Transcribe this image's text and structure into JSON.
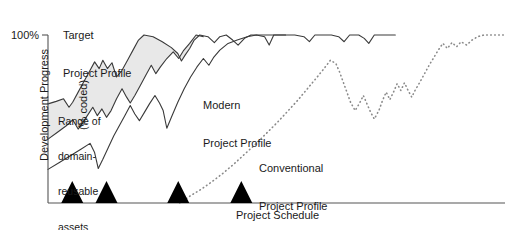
{
  "chart_data": {
    "type": "line",
    "title": "",
    "xlabel": "Project Schedule",
    "ylabel": "Development Progress\n(% coded)",
    "ylabel_line1": "Development Progress",
    "ylabel_line2": "(% coded)",
    "xlim": [
      0,
      100
    ],
    "ylim": [
      0,
      100
    ],
    "grid": false,
    "legend": "inline-annotations",
    "y_ticks": [
      {
        "value": 100,
        "label": "100%"
      }
    ],
    "x_ticks": [],
    "annotations": [
      {
        "name": "target-profile-label",
        "text": "Target\nProject Profile",
        "line1": "Target",
        "line2": "Project Profile",
        "x": 16,
        "y": 97
      },
      {
        "name": "band-label",
        "text": "Range of\ndomain-\nreusable\nassets",
        "line1": "Range of",
        "line2": "domain-",
        "line3": "reusable",
        "line4": "assets",
        "x": 3,
        "y": 66
      },
      {
        "name": "modern-profile-label",
        "text": "Modern\nProject Profile",
        "line1": "Modern",
        "line2": "Project Profile",
        "x": 35,
        "y": 77
      },
      {
        "name": "conventional-profile-label",
        "text": "Conventional\nProject Profile",
        "line1": "Conventional",
        "line2": "Project Profile",
        "x": 49,
        "y": 40
      }
    ],
    "milestone_markers": {
      "name": "milestone-triangles",
      "count": 4,
      "x_values": [
        5.3,
        12.8,
        28.5,
        42.3
      ]
    },
    "series": [
      {
        "name": "Target Project Profile",
        "style": "solid",
        "color": "#3a3a3a",
        "points": [
          [
            0.0,
            59.0
          ],
          [
            1.8,
            60.5
          ],
          [
            3.4,
            62.0
          ],
          [
            4.6,
            57.0
          ],
          [
            5.4,
            60.0
          ],
          [
            6.6,
            66.0
          ],
          [
            7.8,
            72.0
          ],
          [
            9.0,
            78.0
          ],
          [
            10.2,
            84.0
          ],
          [
            11.2,
            80.0
          ],
          [
            12.0,
            85.0
          ],
          [
            13.0,
            80.0
          ],
          [
            14.0,
            83.5
          ],
          [
            15.0,
            75.0
          ],
          [
            16.2,
            79.0
          ],
          [
            17.4,
            85.0
          ],
          [
            18.6,
            91.0
          ],
          [
            19.8,
            97.0
          ],
          [
            21.0,
            100.0
          ],
          [
            23.0,
            99.0
          ],
          [
            25.0,
            96.0
          ],
          [
            27.0,
            92.5
          ],
          [
            28.4,
            89.0
          ],
          [
            29.2,
            84.5
          ],
          [
            30.0,
            88.0
          ],
          [
            31.0,
            92.0
          ],
          [
            32.0,
            97.0
          ],
          [
            33.2,
            100.0
          ],
          [
            35.0,
            99.0
          ],
          [
            36.4,
            95.5
          ],
          [
            37.6,
            99.0
          ],
          [
            39.0,
            100.0
          ],
          [
            40.4,
            97.0
          ],
          [
            41.6,
            94.0
          ],
          [
            43.0,
            98.0
          ],
          [
            44.4,
            100.0
          ],
          [
            52.0,
            100.0
          ]
        ]
      },
      {
        "name": "Range lower bound",
        "style": "solid",
        "color": "#3a3a3a",
        "points": [
          [
            0.0,
            38.0
          ],
          [
            2.0,
            42.0
          ],
          [
            4.0,
            46.0
          ],
          [
            5.4,
            49.5
          ],
          [
            6.6,
            44.0
          ],
          [
            7.4,
            47.0
          ],
          [
            8.6,
            52.0
          ],
          [
            9.8,
            57.0
          ],
          [
            10.8,
            52.0
          ],
          [
            11.8,
            56.0
          ],
          [
            12.8,
            51.0
          ],
          [
            13.8,
            55.0
          ],
          [
            15.0,
            62.0
          ],
          [
            16.2,
            68.0
          ],
          [
            17.2,
            63.0
          ],
          [
            18.0,
            59.5
          ],
          [
            19.0,
            64.0
          ],
          [
            20.2,
            70.0
          ],
          [
            21.4,
            76.0
          ],
          [
            22.6,
            82.0
          ],
          [
            23.6,
            77.0
          ],
          [
            24.6,
            81.0
          ],
          [
            26.0,
            86.0
          ],
          [
            27.4,
            90.0
          ],
          [
            28.6,
            86.0
          ],
          [
            29.6,
            90.5
          ],
          [
            31.0,
            95.0
          ],
          [
            32.4,
            100.0
          ],
          [
            34.0,
            99.0
          ]
        ]
      },
      {
        "name": "Modern Project Profile",
        "style": "solid",
        "color": "#3a3a3a",
        "points": [
          [
            0.0,
            20.0
          ],
          [
            2.4,
            24.0
          ],
          [
            4.8,
            28.0
          ],
          [
            7.2,
            32.0
          ],
          [
            9.2,
            35.5
          ],
          [
            10.2,
            30.0
          ],
          [
            11.0,
            20.5
          ],
          [
            12.0,
            26.0
          ],
          [
            13.2,
            33.0
          ],
          [
            14.4,
            40.0
          ],
          [
            15.6,
            46.0
          ],
          [
            16.8,
            52.0
          ],
          [
            18.0,
            58.0
          ],
          [
            19.0,
            53.0
          ],
          [
            20.0,
            49.0
          ],
          [
            21.0,
            53.5
          ],
          [
            22.2,
            59.0
          ],
          [
            23.4,
            64.0
          ],
          [
            24.4,
            59.5
          ],
          [
            25.2,
            55.0
          ],
          [
            26.0,
            44.5
          ],
          [
            27.0,
            51.0
          ],
          [
            28.4,
            60.0
          ],
          [
            29.8,
            68.0
          ],
          [
            31.2,
            75.0
          ],
          [
            32.6,
            81.0
          ],
          [
            34.0,
            86.0
          ],
          [
            35.2,
            82.0
          ],
          [
            36.2,
            86.5
          ],
          [
            37.6,
            91.0
          ],
          [
            39.4,
            95.0
          ],
          [
            41.4,
            97.0
          ],
          [
            43.6,
            99.0
          ],
          [
            45.6,
            100.0
          ],
          [
            47.4,
            99.0
          ],
          [
            48.4,
            94.0
          ],
          [
            49.4,
            100.0
          ],
          [
            54.0,
            100.0
          ],
          [
            56.0,
            99.0
          ],
          [
            57.2,
            96.0
          ],
          [
            58.4,
            100.0
          ],
          [
            62.0,
            100.0
          ],
          [
            63.6,
            99.0
          ],
          [
            64.8,
            96.0
          ],
          [
            66.0,
            100.0
          ],
          [
            68.0,
            100.0
          ],
          [
            69.2,
            98.0
          ],
          [
            70.2,
            95.0
          ],
          [
            71.4,
            100.0
          ],
          [
            76.0,
            100.0
          ]
        ]
      },
      {
        "name": "Conventional Project Profile",
        "style": "dotted",
        "color": "#8a8a8a",
        "points": [
          [
            28.8,
            0.0
          ],
          [
            31.0,
            4.0
          ],
          [
            33.4,
            8.0
          ],
          [
            35.8,
            12.5
          ],
          [
            38.2,
            17.5
          ],
          [
            40.6,
            23.0
          ],
          [
            43.0,
            29.0
          ],
          [
            45.4,
            35.0
          ],
          [
            47.8,
            41.5
          ],
          [
            50.2,
            48.0
          ],
          [
            52.4,
            54.5
          ],
          [
            54.6,
            61.0
          ],
          [
            56.6,
            67.5
          ],
          [
            58.6,
            74.0
          ],
          [
            60.4,
            80.0
          ],
          [
            61.8,
            85.0
          ],
          [
            63.0,
            83.0
          ],
          [
            63.8,
            78.0
          ],
          [
            64.6,
            72.0
          ],
          [
            65.4,
            66.0
          ],
          [
            66.2,
            60.0
          ],
          [
            67.2,
            55.0
          ],
          [
            68.2,
            59.5
          ],
          [
            69.0,
            64.0
          ],
          [
            69.8,
            59.0
          ],
          [
            70.6,
            54.0
          ],
          [
            71.4,
            50.0
          ],
          [
            72.4,
            55.0
          ],
          [
            73.2,
            61.0
          ],
          [
            74.0,
            66.0
          ],
          [
            74.8,
            61.5
          ],
          [
            75.6,
            66.0
          ],
          [
            76.4,
            71.0
          ],
          [
            77.2,
            67.0
          ],
          [
            78.0,
            71.5
          ],
          [
            78.8,
            67.0
          ],
          [
            79.6,
            63.0
          ],
          [
            80.4,
            67.5
          ],
          [
            81.4,
            72.0
          ],
          [
            82.4,
            77.0
          ],
          [
            83.4,
            82.0
          ],
          [
            84.4,
            86.5
          ],
          [
            85.4,
            91.0
          ],
          [
            86.4,
            95.0
          ],
          [
            87.4,
            92.0
          ],
          [
            88.4,
            95.5
          ],
          [
            89.4,
            93.0
          ],
          [
            90.4,
            96.0
          ],
          [
            91.6,
            94.0
          ],
          [
            92.8,
            97.0
          ],
          [
            94.0,
            99.0
          ],
          [
            95.4,
            100.0
          ],
          [
            100.0,
            100.0
          ]
        ]
      }
    ],
    "shaded_band": {
      "name": "range-of-domain-reusable-assets",
      "fill_color": "#e8e8e8",
      "description": "Range of domain-reusable assets"
    }
  },
  "figure": {
    "background": "#ffffff",
    "axis_color": "#555555",
    "text_color": "#1a1a1a",
    "marker_color": "#000000"
  }
}
